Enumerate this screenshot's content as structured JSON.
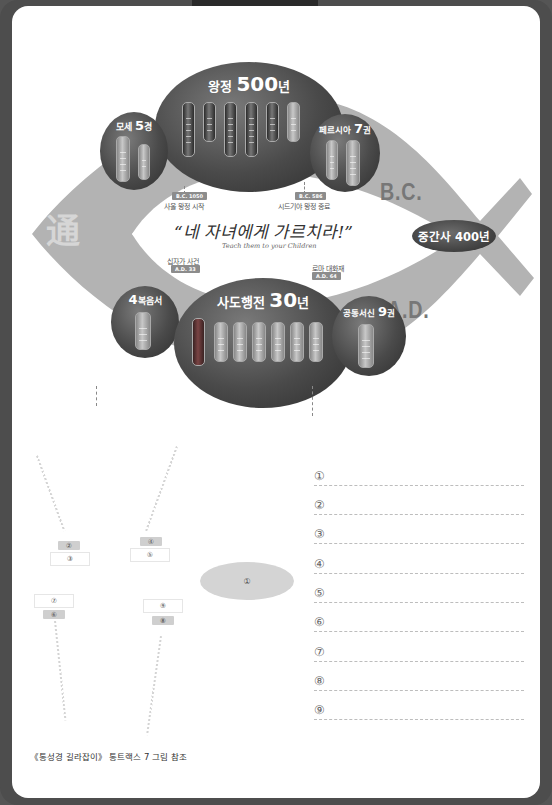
{
  "diagram": {
    "title_glyph": "通",
    "quote": "“네 자녀에게 가르치라!”",
    "quote_en": "Teach them to your Children",
    "era_bc": "B.C.",
    "era_ad": "A.D.",
    "intertestamental": "중간사 400년",
    "nodes": {
      "moses": {
        "title_a": "모세 ",
        "title_num": "5",
        "title_b": "경",
        "tube_label": "40년"
      },
      "kingdom": {
        "title_a": "왕정 ",
        "title_num": "500",
        "title_b": "년"
      },
      "persia": {
        "title_a": "페르시아 ",
        "title_num": "7",
        "title_b": "권",
        "tube_label": "100년"
      },
      "gospels": {
        "title_num": "4",
        "title_b": "복음서",
        "tube_label": "33년"
      },
      "acts": {
        "title_a": "사도행전 ",
        "title_num": "30",
        "title_b": "년"
      },
      "epistles": {
        "title_a": "공동서신 ",
        "title_num": "9",
        "title_b": "권"
      }
    },
    "events": [
      {
        "badge": "B.C. 1050",
        "label": "사울 왕정 시작"
      },
      {
        "badge": "B.C. 586",
        "label": "시드기야 왕정 종료"
      },
      {
        "badge": "A.D. 33",
        "label": "십자가 사건"
      },
      {
        "badge": "A.D. 64",
        "label": "로마 대화재"
      }
    ]
  },
  "worksheet": {
    "oval_label": "①",
    "tags": {
      "t2": "②",
      "t3": "③",
      "t4": "④",
      "t5": "⑤",
      "t6": "⑥",
      "t7": "⑦",
      "t8": "⑧",
      "t9": "⑨"
    },
    "answers": [
      "①",
      "②",
      "③",
      "④",
      "⑤",
      "⑥",
      "⑦",
      "⑧",
      "⑨"
    ]
  },
  "footer": {
    "caption": "《통성경 길라잡이》 통트랙스 7 그림 참조"
  },
  "colors": {
    "frame": "#4d4d4d",
    "band": "#b3b3b3",
    "ellipse_dark": "#3a3a3a",
    "tag_gray": "#cfcfcf"
  }
}
